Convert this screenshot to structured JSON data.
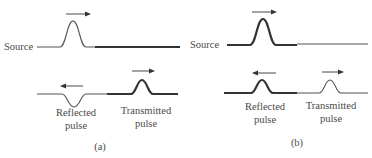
{
  "figure": {
    "panels": [
      {
        "id": "a",
        "caption": "(a)",
        "source_label": "Source",
        "incident": {
          "direction": "right",
          "shape": "upright pulse",
          "medium_in": "thin string",
          "medium_out": "thick string"
        },
        "reflected": {
          "label_line1": "Reflected",
          "label_line2": "pulse",
          "direction": "left",
          "shape": "inverted pulse"
        },
        "transmitted": {
          "label_line1": "Transmitted",
          "label_line2": "pulse",
          "direction": "right",
          "shape": "upright pulse"
        }
      },
      {
        "id": "b",
        "caption": "(b)",
        "source_label": "Source",
        "incident": {
          "direction": "right",
          "shape": "upright pulse",
          "medium_in": "thick string",
          "medium_out": "thin string"
        },
        "reflected": {
          "label_line1": "Reflected",
          "label_line2": "pulse",
          "direction": "left",
          "shape": "upright pulse"
        },
        "transmitted": {
          "label_line1": "Transmitted",
          "label_line2": "pulse",
          "direction": "right",
          "shape": "upright pulse"
        }
      }
    ],
    "colors": {
      "line": "#333333",
      "text": "#4a4a4a"
    }
  }
}
